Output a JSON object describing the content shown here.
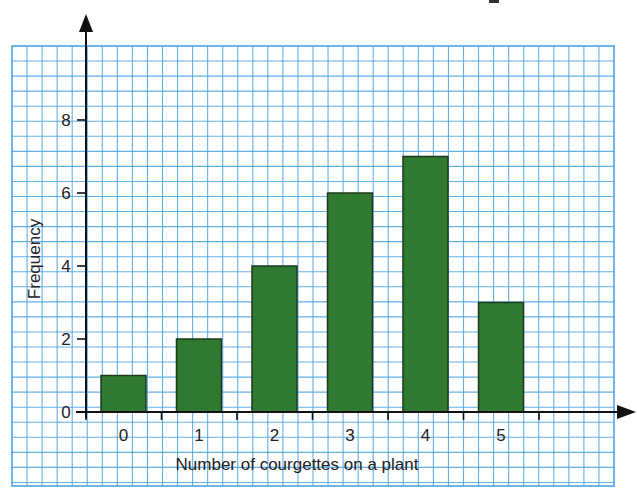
{
  "chart_data": {
    "type": "bar",
    "title": "",
    "xlabel": "Number of courgettes on a plant",
    "ylabel": "Frequency",
    "categories": [
      "0",
      "1",
      "2",
      "3",
      "4",
      "5"
    ],
    "values": [
      1,
      2,
      4,
      6,
      7,
      3
    ],
    "ylim": [
      0,
      9
    ],
    "yticks": [
      0,
      2,
      4,
      6,
      8
    ],
    "grid": true,
    "legend": null
  },
  "style": {
    "bar_fill": "#2f7a30",
    "bar_stroke": "#1c3a1c",
    "grid_color": "#4aa3e6",
    "axis_color": "#111111"
  }
}
